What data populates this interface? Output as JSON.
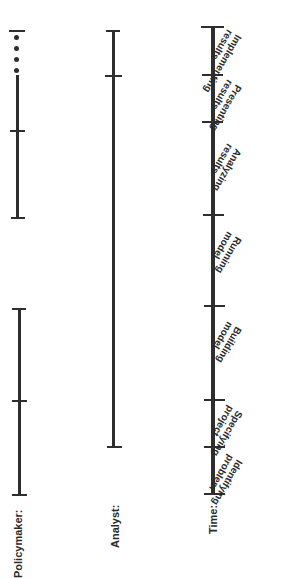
{
  "diagram": {
    "rows": {
      "policymaker": {
        "label": "Policymaker:"
      },
      "analyst": {
        "label": "Analyst:"
      },
      "time": {
        "label": "Time:"
      }
    },
    "phases": [
      {
        "line1": "Identifying",
        "line2": "problem"
      },
      {
        "line1": "Specifying",
        "line2": "project"
      },
      {
        "line1": "Building",
        "line2": "model"
      },
      {
        "line1": "Running",
        "line2": "model"
      },
      {
        "line1": "Analyzing",
        "line2": "results"
      },
      {
        "line1": "Presenting",
        "line2": "results"
      },
      {
        "line1": "Implementing",
        "line2": "results"
      }
    ],
    "time_ticks_y": [
      493,
      447,
      400,
      305,
      215,
      122,
      75,
      27
    ],
    "policymaker_segments": [
      {
        "from_y": 308,
        "to_y": 495,
        "tick_y": 400
      },
      {
        "from_y": 75,
        "to_y": 217,
        "tick_y": 130,
        "continues_with_dots": true
      }
    ],
    "analyst_segment": {
      "from_y": 30,
      "to_y": 447,
      "tick_y": 76
    },
    "line_color": "#2e2e2e"
  }
}
